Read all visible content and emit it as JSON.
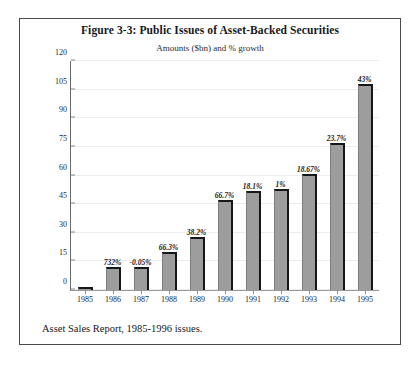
{
  "figure": {
    "title": "Figure 3-3: Public Issues of Asset-Backed Securities",
    "subtitle": "Amounts ($bn) and % growth",
    "caption": "Asset Sales Report, 1985-1996 issues."
  },
  "chart_data": {
    "type": "bar",
    "title": "Figure 3-3: Public Issues of Asset-Backed Securities",
    "subtitle": "Amounts ($bn) and % growth",
    "xlabel": "",
    "ylabel": "",
    "ylim": [
      0,
      120
    ],
    "yticks": [
      0,
      15,
      30,
      45,
      60,
      75,
      90,
      105,
      120
    ],
    "ytick_labels": [
      "0",
      "15",
      "30",
      "45",
      "60",
      "75",
      "90",
      "105",
      "120"
    ],
    "grid": false,
    "legend": "none",
    "categories": [
      "1985",
      "1986",
      "1987",
      "1988",
      "1989",
      "1990",
      "1991",
      "1992",
      "1993",
      "1994",
      "1995"
    ],
    "values": [
      1.5,
      12,
      12,
      20,
      28,
      47,
      52,
      53,
      61,
      77,
      108
    ],
    "point_labels": [
      "",
      "732%",
      "-0.05%",
      "66.3%",
      "38.2%",
      "66.7%",
      "18.1%",
      "1%",
      "18.67%",
      "23.7%",
      "43%"
    ],
    "series": [
      {
        "name": "Amounts ($bn)",
        "values": [
          1.5,
          12,
          12,
          20,
          28,
          47,
          52,
          53,
          61,
          77,
          108
        ]
      }
    ],
    "annotations": [
      {
        "category": "1986",
        "text": "732%"
      },
      {
        "category": "1987",
        "text": "-0.05%"
      },
      {
        "category": "1988",
        "text": "66.3%"
      },
      {
        "category": "1989",
        "text": "38.2%"
      },
      {
        "category": "1990",
        "text": "66.7%"
      },
      {
        "category": "1991",
        "text": "18.1%"
      },
      {
        "category": "1992",
        "text": "1%"
      },
      {
        "category": "1993",
        "text": "18.67%"
      },
      {
        "category": "1994",
        "text": "23.7%"
      },
      {
        "category": "1995",
        "text": "43%"
      }
    ],
    "colors": {
      "bar_fill": "#9d9d9d",
      "bar_edge": "#15171a",
      "axis": "#6a6a6a",
      "text": "#16191c",
      "frame": "#4a4a4a"
    }
  }
}
